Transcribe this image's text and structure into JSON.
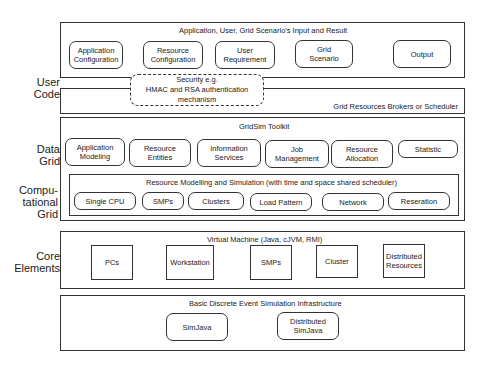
{
  "side_labels": {
    "user_code": [
      "User",
      "Code"
    ],
    "data_grid": [
      "Data",
      "Grid"
    ],
    "computational_grid": [
      "Compu-",
      "tational",
      "Grid"
    ],
    "core_elements": [
      "Core",
      "Elements"
    ]
  },
  "layers": {
    "input_result": {
      "title": "Application, User, Grid Scenario's Input and Result",
      "items": [
        [
          "Application",
          "Configuration"
        ],
        [
          "Resource",
          "Configuration"
        ],
        [
          "User",
          "Requirement"
        ],
        [
          "Grid",
          "Scenario"
        ],
        [
          "Output"
        ]
      ]
    },
    "security": [
      "Security e.g.",
      "HMAC and RSA authentication",
      "mechanism"
    ],
    "brokers": {
      "title": "Grid Resources Brokers or Scheduler"
    },
    "gridsim": {
      "title": "GridSim Toolkit",
      "items": [
        [
          "Application",
          "Modeling"
        ],
        [
          "Resource",
          "Entities"
        ],
        [
          "Information",
          "Services"
        ],
        [
          "Job",
          "Management"
        ],
        [
          "Resource",
          "Allocation"
        ],
        [
          "Statistic"
        ]
      ],
      "resource_modelling": {
        "title": "Resource Modelling and Simulation (with time and space shared scheduler)",
        "items": [
          "Single CPU",
          "SMPs",
          "Clusters",
          "Load Pattern",
          "Network",
          "Reseration"
        ]
      }
    },
    "virtual_machine": {
      "title": "Virtual Machine (Java, cJVM, RMI)",
      "items": [
        [
          "PCs"
        ],
        [
          "Workstation"
        ],
        [
          "SMPs"
        ],
        [
          "Cluster"
        ],
        [
          "Distributed",
          "Resources"
        ]
      ]
    },
    "simulation_infra": {
      "title": "Basic Discrete Event Simulation Infrastructure",
      "items": [
        [
          "SimJava"
        ],
        [
          "Distributed",
          "SimJava"
        ]
      ]
    }
  }
}
